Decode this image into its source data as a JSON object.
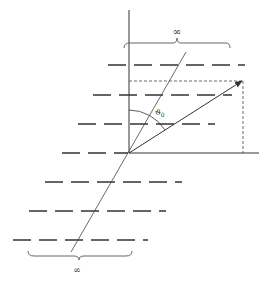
{
  "diagram": {
    "labels": {
      "top_brace": "∞",
      "bottom_brace": "∞",
      "angle": "ϑ",
      "angle_sub": "0"
    },
    "colors": {
      "stroke": "#333333",
      "background": "#ffffff"
    },
    "elements": {
      "vertical_axis": "normal line",
      "layers": "dashed horizontal layers",
      "incident_line": "oblique line through origin",
      "vector": "arrow at angle ϑ0 from normal",
      "projection": "dashed projection box"
    }
  }
}
